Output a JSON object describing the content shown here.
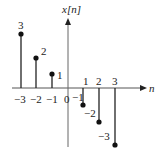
{
  "diagram": {
    "title": "x[n]",
    "x_axis_label": "n",
    "tick_labels": [
      "−3",
      "−2",
      "−1",
      "0",
      "1",
      "2",
      "3"
    ],
    "samples": [
      {
        "n": -3,
        "value": 3,
        "label": "3"
      },
      {
        "n": -2,
        "value": 2,
        "label": "2"
      },
      {
        "n": -1,
        "value": 1,
        "label": "1"
      },
      {
        "n": 1,
        "value": -1,
        "label": "−1"
      },
      {
        "n": 2,
        "value": -2,
        "label": "−2"
      },
      {
        "n": 3,
        "value": -3,
        "label": "−3"
      }
    ],
    "colors": {
      "stem": "#222222",
      "axis": "#555555"
    }
  }
}
